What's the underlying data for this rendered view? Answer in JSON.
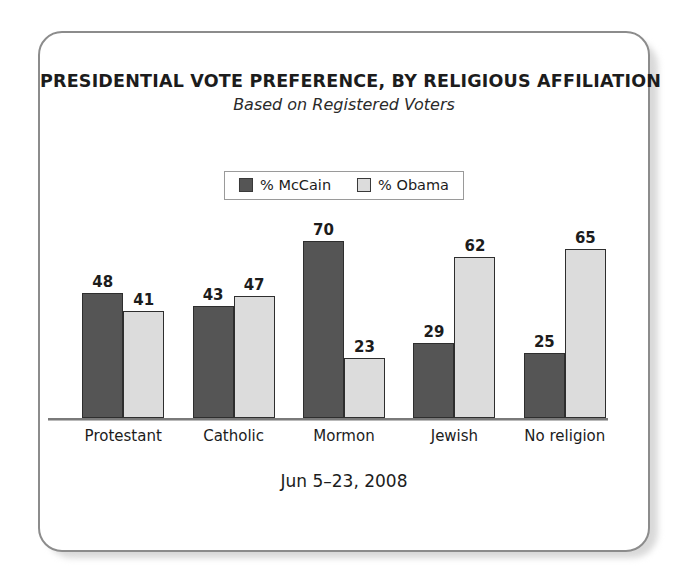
{
  "card": {
    "title": "PRESIDENTIAL VOTE PREFERENCE, BY RELIGIOUS AFFILIATION",
    "subtitle": "Based on Registered Voters",
    "footer_date": "Jun 5–23, 2008"
  },
  "legend": {
    "items": [
      {
        "label": "% McCain",
        "color": "#555555",
        "swatch_name": "legend-swatch-mccain"
      },
      {
        "label": "% Obama",
        "color": "#dcdcdc",
        "swatch_name": "legend-swatch-obama"
      }
    ]
  },
  "chart_data": {
    "type": "bar",
    "title": "PRESIDENTIAL VOTE PREFERENCE, BY RELIGIOUS AFFILIATION",
    "subtitle": "Based on Registered Voters",
    "caption": "Jun 5–23, 2008",
    "xlabel": "",
    "ylabel": "",
    "ylim": [
      0,
      75
    ],
    "grid": false,
    "legend_position": "top-center",
    "categories": [
      "Protestant",
      "Catholic",
      "Mormon",
      "Jewish",
      "No religion"
    ],
    "series": [
      {
        "name": "% McCain",
        "color": "#555555",
        "values": [
          48,
          43,
          70,
          29,
          25
        ]
      },
      {
        "name": "% Obama",
        "color": "#dcdcdc",
        "values": [
          41,
          47,
          23,
          62,
          65
        ]
      }
    ]
  }
}
